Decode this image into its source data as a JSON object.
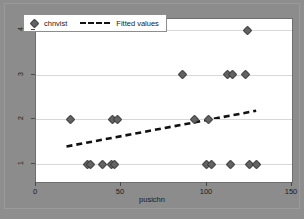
{
  "chart_data": {
    "type": "scatter",
    "title": "",
    "subtitle": "",
    "xlabel": "pusichn",
    "ylabel": "",
    "xlim": [
      0,
      150
    ],
    "ylim": [
      0.6,
      4.25
    ],
    "xticks": [
      0,
      50,
      100,
      150
    ],
    "xtick_labels": [
      "0",
      "50",
      "100",
      "150"
    ],
    "yticks": [
      1,
      2,
      3,
      4
    ],
    "ytick_labels": [
      "1",
      "2",
      "3",
      "4"
    ],
    "grid": "horizontal",
    "legend_position": "top-left",
    "series": [
      {
        "name": "chnvist",
        "type": "scatter",
        "marker": "diamond",
        "color": "#636363",
        "points": [
          {
            "x": 20,
            "y": 2
          },
          {
            "x": 30,
            "y": 1
          },
          {
            "x": 32,
            "y": 1
          },
          {
            "x": 39,
            "y": 1
          },
          {
            "x": 44,
            "y": 1
          },
          {
            "x": 46,
            "y": 1
          },
          {
            "x": 45,
            "y": 2
          },
          {
            "x": 48,
            "y": 2
          },
          {
            "x": 86,
            "y": 3
          },
          {
            "x": 93,
            "y": 2
          },
          {
            "x": 100,
            "y": 1
          },
          {
            "x": 103,
            "y": 1
          },
          {
            "x": 101,
            "y": 2
          },
          {
            "x": 112,
            "y": 3
          },
          {
            "x": 115,
            "y": 3
          },
          {
            "x": 114,
            "y": 1
          },
          {
            "x": 123,
            "y": 3
          },
          {
            "x": 124,
            "y": 4
          },
          {
            "x": 125,
            "y": 1
          },
          {
            "x": 129,
            "y": 1
          }
        ]
      },
      {
        "name": "Fitted values",
        "type": "line",
        "style": "dashed",
        "color": "#111111",
        "x": [
          18,
          130
        ],
        "y": [
          1.36,
          2.17
        ]
      }
    ]
  },
  "legend": {
    "entries": [
      {
        "label": "chnvist",
        "marker": "diamond-marker"
      },
      {
        "label": "Fitted values",
        "marker": "dashed-line"
      }
    ]
  },
  "axes": {
    "x_title": "pusichn",
    "x_tick_labels": [
      "0",
      "50",
      "100",
      "150"
    ],
    "y_tick_labels": [
      "1",
      "2",
      "3",
      "4"
    ]
  },
  "colors": {
    "background": "#8e8e8e",
    "plot_background": "#ffffff",
    "marker": "#636363",
    "fit_line": "#111111",
    "gridline": "#d8d8d8",
    "axis": "#6e6e6e"
  }
}
